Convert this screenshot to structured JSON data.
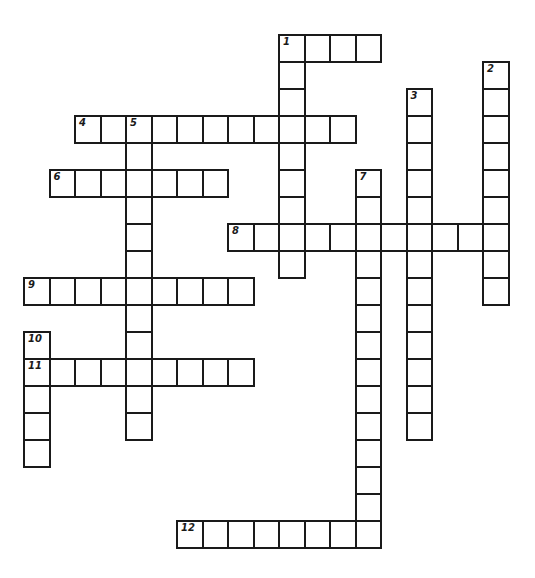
{
  "puzzle": {
    "type": "crossword",
    "grid_origin": {
      "x": 23,
      "y": 7
    },
    "cell_size": {
      "w": 25.5,
      "h": 27
    },
    "line_color": "#1a1a1a",
    "background": "#ffffff",
    "entries": [
      {
        "number": "1",
        "direction": "across",
        "row": 1,
        "col": 10,
        "length": 4
      },
      {
        "number": "1",
        "direction": "down",
        "row": 1,
        "col": 10,
        "length": 9
      },
      {
        "number": "2",
        "direction": "down",
        "row": 2,
        "col": 18,
        "length": 9
      },
      {
        "number": "3",
        "direction": "down",
        "row": 3,
        "col": 15,
        "length": 13
      },
      {
        "number": "4",
        "direction": "across",
        "row": 4,
        "col": 2,
        "length": 11
      },
      {
        "number": "5",
        "direction": "down",
        "row": 4,
        "col": 4,
        "length": 12
      },
      {
        "number": "6",
        "direction": "across",
        "row": 6,
        "col": 1,
        "length": 7
      },
      {
        "number": "7",
        "direction": "down",
        "row": 6,
        "col": 13,
        "length": 14
      },
      {
        "number": "8",
        "direction": "across",
        "row": 8,
        "col": 8,
        "length": 11
      },
      {
        "number": "9",
        "direction": "across",
        "row": 10,
        "col": 0,
        "length": 9
      },
      {
        "number": "10",
        "direction": "down",
        "row": 12,
        "col": 0,
        "length": 5
      },
      {
        "number": "11",
        "direction": "across",
        "row": 13,
        "col": 0,
        "length": 9
      },
      {
        "number": "12",
        "direction": "across",
        "row": 19,
        "col": 6,
        "length": 8
      }
    ]
  }
}
